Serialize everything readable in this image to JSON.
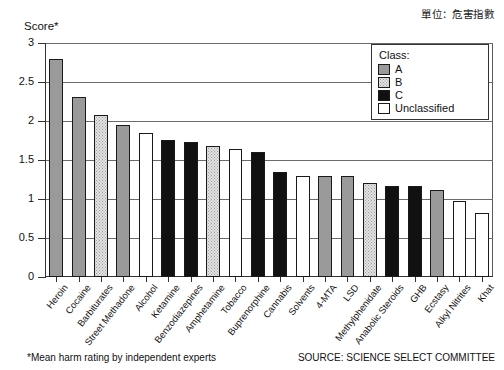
{
  "header": {
    "unit_caption": "單位：危害指數"
  },
  "chart_data": {
    "type": "bar",
    "title": "",
    "xlabel": "",
    "ylabel": "Score*",
    "ylim": [
      0,
      3
    ],
    "yticks": [
      "0",
      "0.5",
      "1",
      "1.5",
      "2",
      "2.5",
      "3"
    ],
    "ytick_values": [
      0,
      0.5,
      1,
      1.5,
      2,
      2.5,
      3
    ],
    "grid": true,
    "legend_position": "top-right",
    "categories": [
      "Heroin",
      "Cocaine",
      "Barbiturates",
      "Street Methadone",
      "Alcohol",
      "Ketamine",
      "Benzodiazepines",
      "Amphetamine",
      "Tobacco",
      "Buprenorphine",
      "Cannabis",
      "Solvents",
      "4-MTA",
      "LSD",
      "Methylphenidate",
      "Anabolic Steroids",
      "GHB",
      "Ecstasy",
      "Alkyl Nitrites",
      "Khat"
    ],
    "values": [
      2.79,
      2.31,
      2.08,
      1.95,
      1.85,
      1.76,
      1.73,
      1.68,
      1.64,
      1.6,
      1.34,
      1.3,
      1.3,
      1.29,
      1.21,
      1.17,
      1.17,
      1.12,
      0.97,
      0.82
    ],
    "classes": [
      "A",
      "A",
      "B",
      "A",
      "Unclassified",
      "C",
      "C",
      "B",
      "Unclassified",
      "C",
      "C",
      "Unclassified",
      "A",
      "A",
      "B",
      "C",
      "C",
      "A",
      "Unclassified",
      "Unclassified"
    ]
  },
  "legend": {
    "title": "Class:",
    "entries": [
      {
        "key": "A",
        "label": "A",
        "color": "#9a9a9a"
      },
      {
        "key": "B",
        "label": "B",
        "color": "#e3e3e3"
      },
      {
        "key": "C",
        "label": "C",
        "color": "#111111"
      },
      {
        "key": "U",
        "label": "Unclassified",
        "color": "#ffffff"
      }
    ]
  },
  "footer": {
    "footnote": "*Mean harm rating by independent experts",
    "source": "SOURCE: SCIENCE SELECT COMMITTEE"
  }
}
